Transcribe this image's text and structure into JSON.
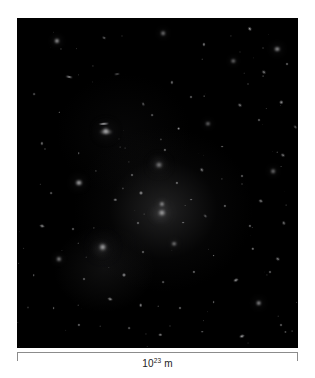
{
  "figure": {
    "kind": "astronomical-image",
    "background_color": "#ffffff",
    "panel_color": "#000000"
  },
  "scale_bar": {
    "mantissa": "10",
    "exponent": "23",
    "unit": "m",
    "full_label": "10^23 m",
    "line_color": "#8c8c8c",
    "text_color": "#222222"
  },
  "chart_data": {
    "type": "scatter",
    "title": "",
    "xlabel": "",
    "ylabel": "",
    "grid": false,
    "legend": null,
    "annotations": [
      "10^23 m"
    ],
    "axis_note": "no axes; single scale bar spanning full image width",
    "objects": [
      {
        "x": 14.2,
        "y": 7.0,
        "rx": 2.6,
        "ry": 2.6,
        "rot": 0,
        "i": 0.95,
        "type": "elliptical"
      },
      {
        "x": 31.0,
        "y": 6.2,
        "rx": 2.0,
        "ry": 1.2,
        "rot": 25,
        "i": 0.6,
        "type": "spiral-edge-on"
      },
      {
        "x": 52.0,
        "y": 4.6,
        "rx": 2.4,
        "ry": 2.2,
        "rot": 0,
        "i": 0.7,
        "type": "elliptical"
      },
      {
        "x": 66.5,
        "y": 8.0,
        "rx": 1.6,
        "ry": 1.6,
        "rot": 0,
        "i": 0.55,
        "type": "compact"
      },
      {
        "x": 83.0,
        "y": 3.4,
        "rx": 2.2,
        "ry": 1.4,
        "rot": 55,
        "i": 0.75,
        "type": "spiral-edge-on"
      },
      {
        "x": 92.5,
        "y": 9.5,
        "rx": 2.8,
        "ry": 2.4,
        "rot": 0,
        "i": 0.85,
        "type": "elliptical"
      },
      {
        "x": 77.0,
        "y": 13.0,
        "rx": 2.2,
        "ry": 2.0,
        "rot": 0,
        "i": 0.72,
        "type": "elliptical"
      },
      {
        "x": 88.0,
        "y": 16.5,
        "rx": 2.0,
        "ry": 1.3,
        "rot": 40,
        "i": 0.62,
        "type": "spiral-edge-on"
      },
      {
        "x": 96.0,
        "y": 14.0,
        "rx": 1.5,
        "ry": 1.5,
        "rot": 0,
        "i": 0.5,
        "type": "compact"
      },
      {
        "x": 18.5,
        "y": 18.0,
        "rx": 3.4,
        "ry": 1.1,
        "rot": 12,
        "i": 0.8,
        "type": "spiral-edge-on"
      },
      {
        "x": 35.5,
        "y": 17.0,
        "rx": 3.0,
        "ry": 0.9,
        "rot": -8,
        "i": 0.45,
        "type": "spiral-edge-on"
      },
      {
        "x": 55.0,
        "y": 19.5,
        "rx": 1.6,
        "ry": 1.6,
        "rot": 0,
        "i": 0.5,
        "type": "compact"
      },
      {
        "x": 6.0,
        "y": 23.0,
        "rx": 1.4,
        "ry": 1.4,
        "rot": 0,
        "i": 0.4,
        "type": "compact"
      },
      {
        "x": 45.0,
        "y": 26.0,
        "rx": 1.8,
        "ry": 1.2,
        "rot": 70,
        "i": 0.55,
        "type": "spiral-edge-on"
      },
      {
        "x": 62.0,
        "y": 24.0,
        "rx": 1.5,
        "ry": 1.5,
        "rot": 0,
        "i": 0.48,
        "type": "compact"
      },
      {
        "x": 79.5,
        "y": 26.5,
        "rx": 2.0,
        "ry": 1.3,
        "rot": 35,
        "i": 0.6,
        "type": "spiral-edge-on"
      },
      {
        "x": 94.0,
        "y": 25.5,
        "rx": 1.7,
        "ry": 1.7,
        "rot": 0,
        "i": 0.58,
        "type": "compact"
      },
      {
        "x": 31.0,
        "y": 32.0,
        "rx": 5.2,
        "ry": 1.2,
        "rot": -4,
        "i": 0.92,
        "type": "spiral-edge-on"
      },
      {
        "x": 48.0,
        "y": 29.5,
        "rx": 1.4,
        "ry": 1.4,
        "rot": 0,
        "i": 0.45,
        "type": "compact"
      },
      {
        "x": 57.5,
        "y": 33.5,
        "rx": 1.9,
        "ry": 1.9,
        "rot": 0,
        "i": 0.62,
        "type": "compact"
      },
      {
        "x": 68.0,
        "y": 32.0,
        "rx": 2.6,
        "ry": 2.3,
        "rot": 0,
        "i": 0.7,
        "type": "elliptical"
      },
      {
        "x": 86.0,
        "y": 31.0,
        "rx": 1.5,
        "ry": 1.5,
        "rot": 0,
        "i": 0.48,
        "type": "compact"
      },
      {
        "x": 99.0,
        "y": 33.0,
        "rx": 1.8,
        "ry": 1.2,
        "rot": 50,
        "i": 0.55,
        "type": "spiral-edge-on"
      },
      {
        "x": 31.5,
        "y": 34.5,
        "rx": 6.5,
        "ry": 2.6,
        "rot": 0,
        "i": 0.55,
        "type": "elliptical"
      },
      {
        "x": 9.0,
        "y": 38.0,
        "rx": 1.6,
        "ry": 1.6,
        "rot": 0,
        "i": 0.5,
        "type": "compact"
      },
      {
        "x": 22.0,
        "y": 41.0,
        "rx": 1.3,
        "ry": 1.3,
        "rot": 0,
        "i": 0.42,
        "type": "compact"
      },
      {
        "x": 52.5,
        "y": 40.0,
        "rx": 1.6,
        "ry": 1.6,
        "rot": 0,
        "i": 0.52,
        "type": "compact"
      },
      {
        "x": 73.0,
        "y": 39.0,
        "rx": 1.4,
        "ry": 1.4,
        "rot": 0,
        "i": 0.45,
        "type": "compact"
      },
      {
        "x": 94.5,
        "y": 41.5,
        "rx": 2.0,
        "ry": 1.3,
        "rot": 30,
        "i": 0.58,
        "type": "spiral-edge-on"
      },
      {
        "x": 31.5,
        "y": 34.2,
        "rx": 3.2,
        "ry": 3.0,
        "rot": 0,
        "i": 0.98,
        "type": "elliptical-bright"
      },
      {
        "x": 22.0,
        "y": 50.0,
        "rx": 3.6,
        "ry": 3.2,
        "rot": 0,
        "i": 0.88,
        "type": "elliptical"
      },
      {
        "x": 41.0,
        "y": 47.5,
        "rx": 1.5,
        "ry": 1.5,
        "rot": 0,
        "i": 0.5,
        "type": "compact"
      },
      {
        "x": 50.5,
        "y": 44.5,
        "rx": 3.0,
        "ry": 2.6,
        "rot": 0,
        "i": 0.96,
        "type": "elliptical-bright"
      },
      {
        "x": 50.0,
        "y": 44.0,
        "rx": 8.0,
        "ry": 7.0,
        "rot": 0,
        "i": 0.42,
        "type": "halo"
      },
      {
        "x": 57.0,
        "y": 50.0,
        "rx": 1.6,
        "ry": 1.6,
        "rot": 0,
        "i": 0.55,
        "type": "compact"
      },
      {
        "x": 66.0,
        "y": 46.0,
        "rx": 2.2,
        "ry": 1.4,
        "rot": 60,
        "i": 0.6,
        "type": "spiral-edge-on"
      },
      {
        "x": 80.0,
        "y": 48.0,
        "rx": 1.5,
        "ry": 1.5,
        "rot": 0,
        "i": 0.48,
        "type": "compact"
      },
      {
        "x": 91.0,
        "y": 46.5,
        "rx": 2.4,
        "ry": 2.2,
        "rot": 0,
        "i": 0.68,
        "type": "elliptical"
      },
      {
        "x": 12.0,
        "y": 53.0,
        "rx": 1.4,
        "ry": 1.4,
        "rot": 0,
        "i": 0.45,
        "type": "compact"
      },
      {
        "x": 35.0,
        "y": 55.0,
        "rx": 1.7,
        "ry": 1.7,
        "rot": 0,
        "i": 0.52,
        "type": "compact"
      },
      {
        "x": 44.0,
        "y": 53.0,
        "rx": 2.0,
        "ry": 2.0,
        "rot": 0,
        "i": 0.6,
        "type": "compact"
      },
      {
        "x": 51.5,
        "y": 56.5,
        "rx": 2.6,
        "ry": 2.4,
        "rot": 0,
        "i": 0.8,
        "type": "elliptical"
      },
      {
        "x": 62.0,
        "y": 55.0,
        "rx": 1.4,
        "ry": 1.4,
        "rot": 0,
        "i": 0.46,
        "type": "compact"
      },
      {
        "x": 74.0,
        "y": 57.0,
        "rx": 1.6,
        "ry": 1.6,
        "rot": 0,
        "i": 0.5,
        "type": "compact"
      },
      {
        "x": 87.0,
        "y": 55.5,
        "rx": 2.2,
        "ry": 1.4,
        "rot": 20,
        "i": 0.62,
        "type": "spiral-edge-on"
      },
      {
        "x": 51.0,
        "y": 59.5,
        "rx": 10.0,
        "ry": 9.0,
        "rot": 0,
        "i": 0.45,
        "type": "halo"
      },
      {
        "x": 51.5,
        "y": 59.0,
        "rx": 3.6,
        "ry": 3.2,
        "rot": 0,
        "i": 1.0,
        "type": "elliptical-bright"
      },
      {
        "x": 43.0,
        "y": 62.0,
        "rx": 1.5,
        "ry": 1.5,
        "rot": 0,
        "i": 0.5,
        "type": "compact"
      },
      {
        "x": 59.0,
        "y": 62.0,
        "rx": 1.4,
        "ry": 1.4,
        "rot": 0,
        "i": 0.48,
        "type": "compact"
      },
      {
        "x": 67.0,
        "y": 60.0,
        "rx": 1.8,
        "ry": 1.2,
        "rot": 45,
        "i": 0.52,
        "type": "spiral-edge-on"
      },
      {
        "x": 9.0,
        "y": 63.0,
        "rx": 2.4,
        "ry": 1.5,
        "rot": 15,
        "i": 0.66,
        "type": "spiral-edge-on"
      },
      {
        "x": 20.0,
        "y": 64.0,
        "rx": 1.5,
        "ry": 1.5,
        "rot": 0,
        "i": 0.48,
        "type": "compact"
      },
      {
        "x": 83.0,
        "y": 63.0,
        "rx": 1.6,
        "ry": 1.6,
        "rot": 0,
        "i": 0.52,
        "type": "compact"
      },
      {
        "x": 95.0,
        "y": 62.0,
        "rx": 2.0,
        "ry": 1.3,
        "rot": 70,
        "i": 0.55,
        "type": "spiral-edge-on"
      },
      {
        "x": 30.0,
        "y": 70.0,
        "rx": 9.0,
        "ry": 8.0,
        "rot": 0,
        "i": 0.4,
        "type": "halo"
      },
      {
        "x": 30.5,
        "y": 69.5,
        "rx": 3.8,
        "ry": 3.4,
        "rot": 0,
        "i": 0.99,
        "type": "elliptical-bright"
      },
      {
        "x": 15.0,
        "y": 73.0,
        "rx": 2.6,
        "ry": 2.4,
        "rot": 0,
        "i": 0.8,
        "type": "elliptical"
      },
      {
        "x": 45.0,
        "y": 71.0,
        "rx": 1.5,
        "ry": 1.5,
        "rot": 0,
        "i": 0.5,
        "type": "compact"
      },
      {
        "x": 56.0,
        "y": 68.5,
        "rx": 2.4,
        "ry": 2.2,
        "rot": 0,
        "i": 0.78,
        "type": "elliptical"
      },
      {
        "x": 70.0,
        "y": 72.0,
        "rx": 1.4,
        "ry": 1.4,
        "rot": 0,
        "i": 0.46,
        "type": "compact"
      },
      {
        "x": 84.0,
        "y": 70.0,
        "rx": 1.7,
        "ry": 1.7,
        "rot": 0,
        "i": 0.55,
        "type": "compact"
      },
      {
        "x": 93.0,
        "y": 73.0,
        "rx": 2.2,
        "ry": 1.4,
        "rot": 35,
        "i": 0.6,
        "type": "spiral-edge-on"
      },
      {
        "x": 6.0,
        "y": 78.0,
        "rx": 1.3,
        "ry": 1.3,
        "rot": 0,
        "i": 0.42,
        "type": "compact"
      },
      {
        "x": 24.0,
        "y": 79.0,
        "rx": 1.5,
        "ry": 1.5,
        "rot": 0,
        "i": 0.48,
        "type": "compact"
      },
      {
        "x": 38.0,
        "y": 78.0,
        "rx": 2.0,
        "ry": 2.0,
        "rot": 0,
        "i": 0.6,
        "type": "compact"
      },
      {
        "x": 52.0,
        "y": 80.0,
        "rx": 1.4,
        "ry": 1.4,
        "rot": 0,
        "i": 0.45,
        "type": "compact"
      },
      {
        "x": 63.0,
        "y": 77.0,
        "rx": 1.6,
        "ry": 1.6,
        "rot": 0,
        "i": 0.52,
        "type": "compact"
      },
      {
        "x": 78.0,
        "y": 79.5,
        "rx": 2.6,
        "ry": 1.4,
        "rot": -25,
        "i": 0.68,
        "type": "spiral-edge-on"
      },
      {
        "x": 90.0,
        "y": 77.0,
        "rx": 1.5,
        "ry": 1.5,
        "rot": 0,
        "i": 0.48,
        "type": "compact"
      },
      {
        "x": 33.0,
        "y": 85.0,
        "rx": 2.4,
        "ry": 1.4,
        "rot": 20,
        "i": 0.64,
        "type": "spiral-edge-on"
      },
      {
        "x": 44.0,
        "y": 87.0,
        "rx": 1.8,
        "ry": 1.8,
        "rot": 0,
        "i": 0.58,
        "type": "compact"
      },
      {
        "x": 13.0,
        "y": 88.0,
        "rx": 1.4,
        "ry": 1.4,
        "rot": 0,
        "i": 0.45,
        "type": "compact"
      },
      {
        "x": 58.0,
        "y": 88.0,
        "rx": 1.5,
        "ry": 1.5,
        "rot": 0,
        "i": 0.5,
        "type": "compact"
      },
      {
        "x": 70.0,
        "y": 86.0,
        "rx": 1.4,
        "ry": 1.4,
        "rot": 0,
        "i": 0.46,
        "type": "compact"
      },
      {
        "x": 86.0,
        "y": 86.5,
        "rx": 2.8,
        "ry": 2.4,
        "rot": 0,
        "i": 0.85,
        "type": "elliptical"
      },
      {
        "x": 22.0,
        "y": 93.0,
        "rx": 1.6,
        "ry": 1.6,
        "rot": 0,
        "i": 0.52,
        "type": "compact"
      },
      {
        "x": 40.0,
        "y": 94.0,
        "rx": 1.4,
        "ry": 1.4,
        "rot": 0,
        "i": 0.45,
        "type": "compact"
      },
      {
        "x": 51.0,
        "y": 96.0,
        "rx": 1.7,
        "ry": 1.7,
        "rot": 0,
        "i": 0.55,
        "type": "compact"
      },
      {
        "x": 66.0,
        "y": 95.0,
        "rx": 1.3,
        "ry": 1.3,
        "rot": 0,
        "i": 0.42,
        "type": "compact"
      },
      {
        "x": 80.0,
        "y": 96.5,
        "rx": 2.6,
        "ry": 1.3,
        "rot": -20,
        "i": 0.72,
        "type": "spiral-edge-on"
      },
      {
        "x": 94.0,
        "y": 93.0,
        "rx": 1.5,
        "ry": 1.5,
        "rot": 0,
        "i": 0.48,
        "type": "compact"
      }
    ]
  }
}
